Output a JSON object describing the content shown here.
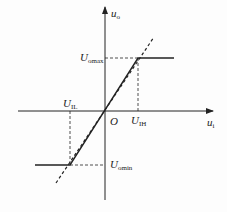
{
  "diagram": {
    "type": "transfer-characteristic",
    "axes": {
      "x_label": "u",
      "x_label_sub": "i",
      "y_label": "u",
      "y_label_sub": "o",
      "origin_label": "O"
    },
    "levels": {
      "output_max": {
        "label": "U",
        "sub": "omax"
      },
      "output_min": {
        "label": "U",
        "sub": "omin"
      },
      "input_high": {
        "label": "U",
        "sub": "IH"
      },
      "input_low": {
        "label": "U",
        "sub": "IL"
      }
    },
    "colors": {
      "line": "#222222",
      "background": "#fdfdfd"
    }
  }
}
